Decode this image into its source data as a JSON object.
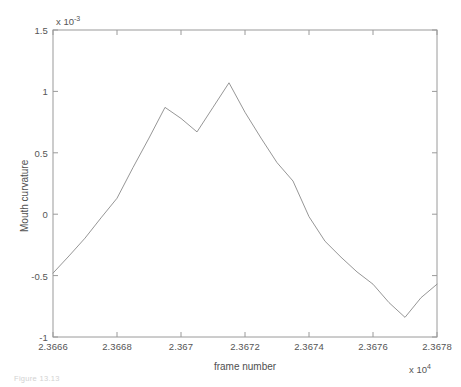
{
  "figure": {
    "caption": "Figure 13.13"
  },
  "chart_data": {
    "type": "line",
    "title": "",
    "xlabel": "frame number",
    "ylabel": "Mouth curvature",
    "x_exponent_label": "x 10",
    "x_exponent_power": "4",
    "y_exponent_label": "x 10",
    "y_exponent_power": "-3",
    "x_multiplier": 10000,
    "y_multiplier": 0.001,
    "xlim": [
      2.3666,
      2.3678
    ],
    "ylim": [
      -1.0,
      1.5
    ],
    "xticks": [
      2.3666,
      2.3668,
      2.367,
      2.3672,
      2.3674,
      2.3676,
      2.3678
    ],
    "xtick_labels": [
      "2.3666",
      "2.3668",
      "2.367",
      "2.3672",
      "2.3674",
      "2.3676",
      "2.3678"
    ],
    "yticks": [
      1.5,
      1,
      0.5,
      0,
      -0.5,
      -1
    ],
    "ytick_labels": [
      "1.5",
      "1",
      "0.5",
      "0",
      "-0.5",
      "-1"
    ],
    "grid": false,
    "legend": null,
    "line_color": "#8a8a8a",
    "line_width": 0.9,
    "series": [
      {
        "name": "mouth curvature",
        "x": [
          2.3666,
          2.36665,
          2.3667,
          2.36675,
          2.3668,
          2.36685,
          2.3669,
          2.36695,
          2.367,
          2.36705,
          2.3671,
          2.36715,
          2.3672,
          2.36725,
          2.3673,
          2.36735,
          2.3674,
          2.36745,
          2.3675,
          2.36755,
          2.3676,
          2.36765,
          2.3677,
          2.36775,
          2.3678
        ],
        "y": [
          -0.48,
          -0.34,
          -0.195,
          -0.03,
          0.13,
          0.38,
          0.62,
          0.87,
          0.78,
          0.67,
          0.87,
          1.07,
          0.83,
          0.62,
          0.42,
          0.27,
          -0.02,
          -0.22,
          -0.35,
          -0.47,
          -0.57,
          -0.72,
          -0.84,
          -0.68,
          -0.57
        ]
      }
    ],
    "vertices_note": "values in units of 1e-3; x in units of 1e4"
  },
  "axes": {
    "box_color": "#9a9a9a",
    "tick_color": "#9a9a9a",
    "background": "#ffffff"
  }
}
